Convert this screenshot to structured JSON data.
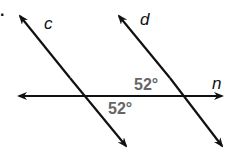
{
  "diagram": {
    "problem_marker": ".",
    "lines": [
      {
        "name": "c",
        "label": "c",
        "type": "transversal"
      },
      {
        "name": "d",
        "label": "d",
        "type": "transversal"
      },
      {
        "name": "n",
        "label": "n",
        "type": "line"
      }
    ],
    "angles": [
      {
        "label": "52°",
        "position": "above n, left of d"
      },
      {
        "label": "52°",
        "position": "below n, right of c"
      }
    ],
    "colors": {
      "line": "#111111",
      "angle_text": "#666666"
    }
  }
}
